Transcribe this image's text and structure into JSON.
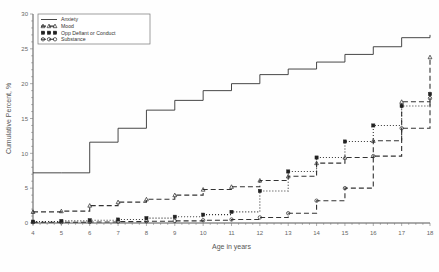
{
  "chart_data": {
    "type": "line",
    "title": "",
    "xlabel": "Age in years",
    "ylabel": "Cumulative Percent, %",
    "xlim": [
      4,
      18
    ],
    "ylim": [
      0,
      30
    ],
    "xticks": [
      4,
      5,
      6,
      7,
      8,
      9,
      10,
      11,
      12,
      13,
      14,
      15,
      16,
      17,
      18
    ],
    "yticks": [
      0,
      5,
      10,
      15,
      20,
      25,
      30
    ],
    "grid": false,
    "legend_position": "top-left",
    "x": [
      4,
      5,
      6,
      7,
      8,
      9,
      10,
      11,
      12,
      13,
      14,
      15,
      16,
      17,
      18
    ],
    "series": [
      {
        "name": "Anxiety",
        "style": "solid",
        "marker": "none",
        "color": "#333333",
        "values": [
          7.2,
          7.2,
          11.6,
          13.6,
          16.2,
          17.6,
          19.0,
          20.0,
          21.3,
          22.1,
          23.1,
          24.2,
          25.3,
          26.6,
          27.0
        ]
      },
      {
        "name": "Mood",
        "style": "dashed",
        "marker": "triangle",
        "color": "#333333",
        "values": [
          1.6,
          1.7,
          2.5,
          3.0,
          3.4,
          4.0,
          4.8,
          5.2,
          6.1,
          6.7,
          8.6,
          9.4,
          11.8,
          17.4,
          23.8
        ]
      },
      {
        "name": "Opp Defiant or Conduct",
        "style": "dotted",
        "marker": "square",
        "color": "#333333",
        "values": [
          0.2,
          0.3,
          0.4,
          0.5,
          0.7,
          0.9,
          1.2,
          1.6,
          4.6,
          7.4,
          9.4,
          11.7,
          14.0,
          16.8,
          18.5
        ]
      },
      {
        "name": "Substance",
        "style": "dashed",
        "marker": "circle",
        "color": "#333333",
        "values": [
          0.1,
          0.1,
          0.15,
          0.2,
          0.25,
          0.3,
          0.4,
          0.5,
          0.8,
          1.4,
          3.2,
          5.0,
          9.6,
          13.6,
          17.9
        ]
      }
    ]
  }
}
